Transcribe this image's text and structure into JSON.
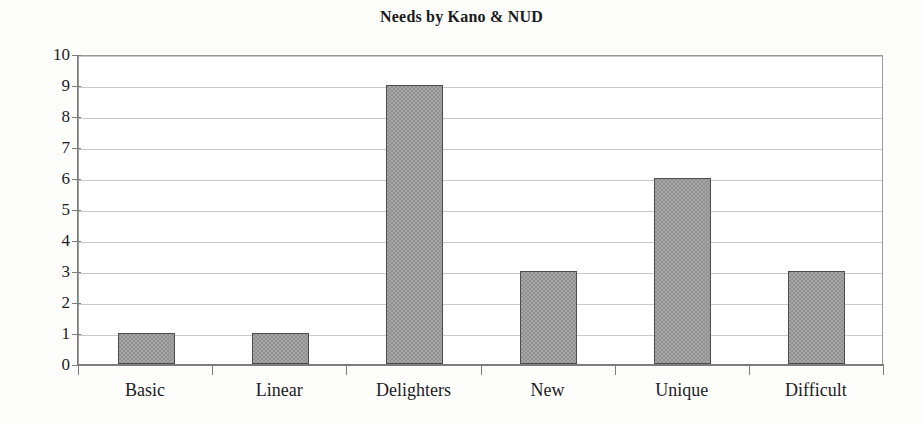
{
  "chart_data": {
    "type": "bar",
    "title": "Needs by Kano & NUD",
    "categories": [
      "Basic",
      "Linear",
      "Delighters",
      "New",
      "Unique",
      "Difficult"
    ],
    "values": [
      1,
      1,
      9,
      3,
      6,
      3
    ],
    "xlabel": "",
    "ylabel": "",
    "ylim": [
      0,
      10
    ],
    "ytick_labels": [
      "10",
      "9",
      "8",
      "7",
      "6",
      "5",
      "4",
      "3",
      "2",
      "1",
      "0"
    ],
    "ytick_values": [
      10,
      9,
      8,
      7,
      6,
      5,
      4,
      3,
      2,
      1,
      0
    ],
    "grid": true,
    "legend": false,
    "legend_position": "none",
    "colors": {
      "bar_fill": "#919191",
      "bar_border": "#4d4d4d",
      "gridline": "#c9c9c9",
      "axis": "#7d7d7d",
      "text": "#1c1c1c",
      "background": "#fdfdfc",
      "plot_background": "#ffffff"
    }
  }
}
